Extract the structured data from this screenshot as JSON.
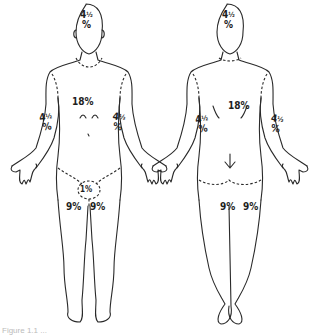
{
  "diagram": {
    "views": [
      {
        "name": "anterior",
        "labels": {
          "head": {
            "whole": "4",
            "fraction": "½",
            "unit": "%"
          },
          "trunk": "18%",
          "left_arm": {
            "whole": "4",
            "fraction": "½",
            "unit": "%"
          },
          "right_arm": {
            "whole": "4",
            "fraction": "½",
            "unit": "%"
          },
          "genitals": "1%",
          "left_leg": "9%",
          "right_leg": "9%"
        }
      },
      {
        "name": "posterior",
        "labels": {
          "head": {
            "whole": "4",
            "fraction": "½",
            "unit": "%"
          },
          "trunk": "18%",
          "left_arm": {
            "whole": "4",
            "fraction": "½",
            "unit": "%"
          },
          "right_arm": {
            "whole": "4",
            "fraction": "½",
            "unit": "%"
          },
          "left_leg": "9%",
          "right_leg": "9%"
        }
      }
    ],
    "caption": "Figure 1.1 ..."
  },
  "colors": {
    "line": "#2a2a2a",
    "text": "#1e1e1e",
    "background": "#ffffff"
  }
}
